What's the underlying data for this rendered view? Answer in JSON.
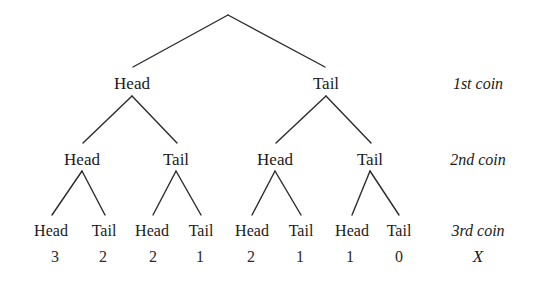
{
  "diagram": {
    "background_color": "#ffffff",
    "line_color": "#2b2b2b",
    "text_color": "#1a1a1a"
  },
  "levels": [
    {
      "row_label": "1st coin",
      "nodes": [
        {
          "label": "Head",
          "x": 132,
          "y": 84
        },
        {
          "label": "Tail",
          "x": 326,
          "y": 84
        }
      ]
    },
    {
      "row_label": "2nd coin",
      "nodes": [
        {
          "label": "Head",
          "x": 82,
          "y": 160
        },
        {
          "label": "Tail",
          "x": 176,
          "y": 160
        },
        {
          "label": "Head",
          "x": 275,
          "y": 160
        },
        {
          "label": "Tail",
          "x": 370,
          "y": 160
        }
      ]
    },
    {
      "row_label": "3rd coin",
      "nodes": [
        {
          "label": "Head",
          "x": 51,
          "y": 231
        },
        {
          "label": "Tail",
          "x": 104,
          "y": 231
        },
        {
          "label": "Head",
          "x": 152,
          "y": 231
        },
        {
          "label": "Tail",
          "x": 201,
          "y": 231
        },
        {
          "label": "Head",
          "x": 252,
          "y": 231
        },
        {
          "label": "Tail",
          "x": 301,
          "y": 231
        },
        {
          "label": "Head",
          "x": 352,
          "y": 231
        },
        {
          "label": "Tail",
          "x": 399,
          "y": 231
        }
      ]
    }
  ],
  "values_row": {
    "row_label": "X",
    "row_label_x": 478,
    "row_label_y": 257,
    "values": [
      {
        "value": "3",
        "x": 55,
        "y": 257
      },
      {
        "value": "2",
        "x": 103,
        "y": 257
      },
      {
        "value": "2",
        "x": 153,
        "y": 257
      },
      {
        "value": "1",
        "x": 200,
        "y": 257
      },
      {
        "value": "2",
        "x": 251,
        "y": 257
      },
      {
        "value": "1",
        "x": 300,
        "y": 257
      },
      {
        "value": "1",
        "x": 350,
        "y": 257
      },
      {
        "value": "0",
        "x": 399,
        "y": 257
      }
    ]
  },
  "row_labels": [
    {
      "text": "1st coin",
      "x": 478,
      "y": 84
    },
    {
      "text": "2nd coin",
      "x": 478,
      "y": 160
    },
    {
      "text": "3rd coin",
      "x": 478,
      "y": 231
    }
  ],
  "branches": [
    {
      "x1": 228,
      "y1": 15,
      "x2": 133,
      "y2": 67
    },
    {
      "x1": 228,
      "y1": 15,
      "x2": 325,
      "y2": 67
    },
    {
      "x1": 132,
      "y1": 96,
      "x2": 83,
      "y2": 143
    },
    {
      "x1": 132,
      "y1": 96,
      "x2": 177,
      "y2": 143
    },
    {
      "x1": 326,
      "y1": 96,
      "x2": 276,
      "y2": 143
    },
    {
      "x1": 326,
      "y1": 96,
      "x2": 371,
      "y2": 143
    },
    {
      "x1": 82,
      "y1": 171,
      "x2": 52,
      "y2": 215
    },
    {
      "x1": 82,
      "y1": 171,
      "x2": 105,
      "y2": 215
    },
    {
      "x1": 176,
      "y1": 171,
      "x2": 153,
      "y2": 215
    },
    {
      "x1": 176,
      "y1": 171,
      "x2": 201,
      "y2": 215
    },
    {
      "x1": 275,
      "y1": 171,
      "x2": 252,
      "y2": 215
    },
    {
      "x1": 275,
      "y1": 171,
      "x2": 301,
      "y2": 215
    },
    {
      "x1": 370,
      "y1": 171,
      "x2": 352,
      "y2": 215
    },
    {
      "x1": 370,
      "y1": 171,
      "x2": 399,
      "y2": 215
    }
  ]
}
